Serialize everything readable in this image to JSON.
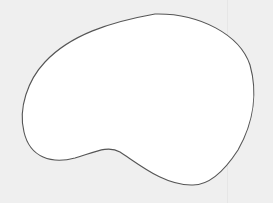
{
  "figure": {
    "shape": "blob-outline",
    "fill_color": "#ffffff",
    "stroke_color": "#555555",
    "background_color": "#efefef"
  }
}
